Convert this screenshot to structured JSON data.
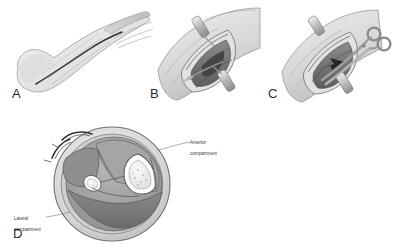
{
  "figure": {
    "background_color": "#ffffff",
    "ink_color": "#3a3a3a"
  },
  "panels": [
    {
      "id": "A",
      "letter": "A",
      "caption": "Lateral view of leg and foot with planned skin incision line",
      "icon": "leg-lateral-incision"
    },
    {
      "id": "B",
      "letter": "B",
      "caption": "Open wound held by retractors exposing fascia",
      "icon": "open-wound-retractors"
    },
    {
      "id": "C",
      "letter": "C",
      "caption": "Long scissors dividing the fascia within the wound",
      "icon": "scissors-fasciotomy"
    },
    {
      "id": "D",
      "letter": "D",
      "caption": "Cross section of the leg showing muscle compartments, tibia and fibula",
      "icon": "leg-cross-section"
    }
  ],
  "annotations": {
    "anterior": {
      "label": "Anterior\ncompartment",
      "line1": "Anterior",
      "line2": "compartment"
    },
    "lateral": {
      "label": "Lateral\ncompartment",
      "line1": "Lateral",
      "line2": "compartment"
    }
  },
  "colors": {
    "outline": "#4a4a4a",
    "skin_light": "#e8e8e8",
    "muscle_mid": "#9a9a9a",
    "muscle_dark": "#6f6f6f",
    "bone_light": "#ededed",
    "instrument": "#bdbdbd",
    "shadow": "#7d7d7d"
  }
}
